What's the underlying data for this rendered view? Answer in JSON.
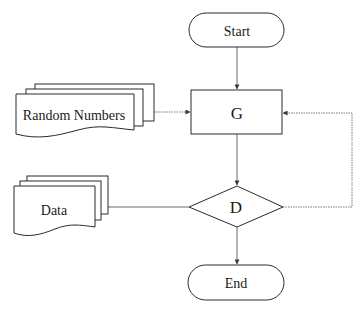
{
  "diagram": {
    "type": "flowchart",
    "nodes": {
      "start": {
        "label": "Start",
        "shape": "terminator"
      },
      "g": {
        "label": "G",
        "shape": "process"
      },
      "random_numbers": {
        "label": "Random Numbers",
        "shape": "multi-document"
      },
      "data": {
        "label": "Data",
        "shape": "multi-document"
      },
      "d": {
        "label": "D",
        "shape": "decision"
      },
      "end": {
        "label": "End",
        "shape": "terminator"
      }
    },
    "edges": [
      {
        "from": "Start",
        "to": "G",
        "style": "solid",
        "arrow": true
      },
      {
        "from": "Random Numbers",
        "to": "G",
        "style": "dotted",
        "arrow": true
      },
      {
        "from": "G",
        "to": "D",
        "style": "solid",
        "arrow": true
      },
      {
        "from": "Data",
        "to": "D",
        "style": "solid",
        "arrow": false
      },
      {
        "from": "D",
        "to": "G",
        "style": "dotted",
        "arrow": true,
        "route": "right loop"
      },
      {
        "from": "D",
        "to": "End",
        "style": "solid",
        "arrow": true
      }
    ]
  }
}
